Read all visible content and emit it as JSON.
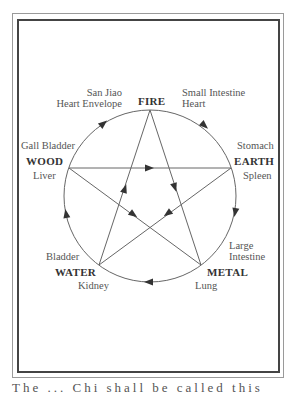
{
  "elements": {
    "fire": {
      "name": "FIRE",
      "yang": "San Jiao",
      "yin": "Heart Envelope",
      "yang2": "Small Intestine",
      "yin2": "Heart"
    },
    "earth": {
      "name": "EARTH",
      "yang": "Stomach",
      "yin": "Spleen"
    },
    "metal": {
      "name": "METAL",
      "yang": "Large",
      "yang_line2": "Intestine",
      "yin": "Lung"
    },
    "water": {
      "name": "WATER",
      "yang": "Bladder",
      "yin": "Kidney"
    },
    "wood": {
      "name": "WOOD",
      "yang": "Gall Bladder",
      "yin": "Liver"
    }
  },
  "caption": "The    ...    Chi    shall    be    called    this",
  "colors": {
    "line": "#555555",
    "frame": "#444444",
    "text": "#555555",
    "element_text": "#333333"
  }
}
